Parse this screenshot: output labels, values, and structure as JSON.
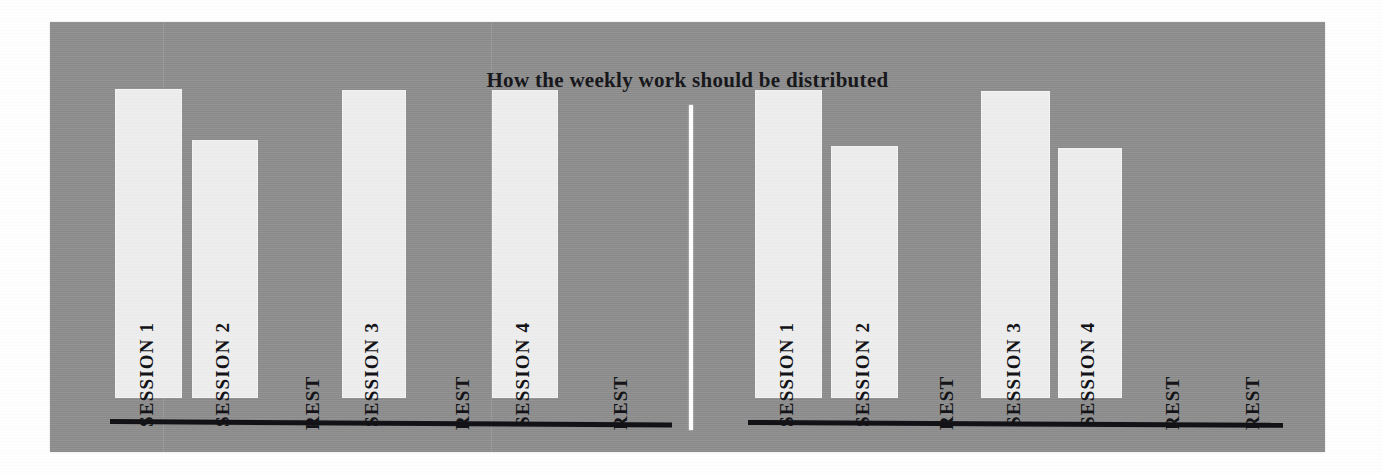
{
  "figure": {
    "title": "How the weekly work should be distributed",
    "background_color": "#8e8e8e",
    "bar_color": "#ededed",
    "axis_color": "#111115",
    "label_color": "#121216",
    "divider_color": "#fdfdfd"
  },
  "chart_data": {
    "type": "bar",
    "title": "How the weekly work should be distributed",
    "xlabel": "",
    "ylabel": "",
    "ylim": [
      0,
      100
    ],
    "grid": false,
    "legend_position": "none",
    "panel_count": 2,
    "panels": [
      {
        "name": "left-schedule",
        "categories": [
          "SESSION 1",
          "SESSION 2",
          "REST",
          "SESSION 3",
          "REST",
          "SESSION 4",
          "REST"
        ],
        "values": [
          100,
          84,
          0,
          99,
          0,
          99,
          0
        ],
        "bar_tops_px": [
          111,
          162,
          null,
          112,
          null,
          112,
          null
        ],
        "baseline_y_px": 420
      },
      {
        "name": "right-schedule",
        "categories": [
          "SESSION 1",
          "SESSION 2",
          "REST",
          "SESSION 3",
          "SESSION 4",
          "REST",
          "REST"
        ],
        "values": [
          99,
          82,
          0,
          98,
          81,
          0,
          0
        ],
        "bar_tops_px": [
          112,
          168,
          null,
          113,
          170,
          null,
          null
        ],
        "baseline_y_px": 421
      }
    ]
  },
  "left_chart": {
    "slots": [
      {
        "label": "SESSION 1",
        "is_rest": false,
        "x": 65,
        "width": 67,
        "height": 309
      },
      {
        "label": "SESSION 2",
        "is_rest": false,
        "x": 142,
        "width": 66,
        "height": 258
      },
      {
        "label": "REST",
        "is_rest": true,
        "x": 232,
        "width": 66,
        "height": 0
      },
      {
        "label": "SESSION 3",
        "is_rest": false,
        "x": 292,
        "width": 64,
        "height": 308
      },
      {
        "label": "REST",
        "is_rest": true,
        "x": 382,
        "width": 66,
        "height": 0
      },
      {
        "label": "SESSION 4",
        "is_rest": false,
        "x": 442,
        "width": 66,
        "height": 308
      },
      {
        "label": "REST",
        "is_rest": true,
        "x": 540,
        "width": 66,
        "height": 0
      }
    ]
  },
  "right_chart": {
    "slots": [
      {
        "label": "SESSION 1",
        "is_rest": false,
        "x": 65,
        "width": 67,
        "height": 308
      },
      {
        "label": "SESSION 2",
        "is_rest": false,
        "x": 141,
        "width": 67,
        "height": 252
      },
      {
        "label": "REST",
        "is_rest": true,
        "x": 226,
        "width": 66,
        "height": 0
      },
      {
        "label": "SESSION 3",
        "is_rest": false,
        "x": 291,
        "width": 69,
        "height": 307
      },
      {
        "label": "SESSION 4",
        "is_rest": false,
        "x": 368,
        "width": 64,
        "height": 250
      },
      {
        "label": "REST",
        "is_rest": true,
        "x": 452,
        "width": 66,
        "height": 0
      },
      {
        "label": "REST",
        "is_rest": true,
        "x": 532,
        "width": 66,
        "height": 0
      }
    ]
  }
}
